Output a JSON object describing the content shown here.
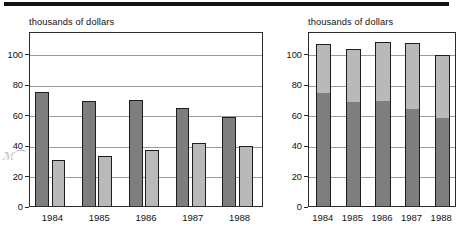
{
  "page": {
    "background_color": "#ffffff",
    "rule_color": "#121212"
  },
  "palette": {
    "dark_series": "#7e7e7e",
    "light_series": "#b9b9b9",
    "outline": "#1d1d1d",
    "grid": "#9a9a9a",
    "frame": "#2b2b2b",
    "text": "#111111"
  },
  "annotation": {
    "margin_scribble": "ℳ⁀"
  },
  "charts": [
    {
      "id": "grouped-bar-chart",
      "chart_data": {
        "type": "bar",
        "title": "",
        "subtitle": "",
        "xlabel": "",
        "ylabel": "thousands of dollars",
        "categories": [
          "1984",
          "1985",
          "1986",
          "1987",
          "1988"
        ],
        "yticks": [
          0,
          20,
          40,
          60,
          80,
          100
        ],
        "ylim": [
          0,
          115
        ],
        "grid": true,
        "legend": "none",
        "grouping": "grouped",
        "series": [
          {
            "name": "dark",
            "color": "#7e7e7e",
            "values": [
              76,
              70.5,
              71,
              65.5,
              60
            ]
          },
          {
            "name": "light",
            "color": "#b9b9b9",
            "values": [
              31.5,
              34,
              38,
              43,
              40.5
            ]
          }
        ]
      }
    },
    {
      "id": "stacked-bar-chart",
      "chart_data": {
        "type": "bar",
        "title": "",
        "subtitle": "",
        "xlabel": "",
        "ylabel": "thousands of dollars",
        "categories": [
          "1984",
          "1985",
          "1986",
          "1987",
          "1988"
        ],
        "yticks": [
          0,
          20,
          40,
          60,
          80,
          100
        ],
        "ylim": [
          0,
          115
        ],
        "grid": true,
        "legend": "none",
        "grouping": "stacked",
        "series": [
          {
            "name": "dark",
            "color": "#7e7e7e",
            "values": [
              76,
              70.5,
              71,
              65.5,
              60
            ]
          },
          {
            "name": "light",
            "color": "#b9b9b9",
            "values": [
              31.5,
              34,
              38,
              43,
              40.5
            ]
          }
        ],
        "totals": [
          107.5,
          104.5,
          109,
          108.5,
          100.5
        ]
      }
    }
  ]
}
